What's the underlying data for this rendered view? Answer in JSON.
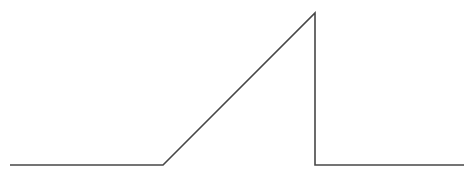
{
  "diagram": {
    "type": "waveform",
    "stroke_color": "#474747",
    "background_color": "#ffffff",
    "stroke_width": 1.6,
    "points": [
      {
        "x": 10,
        "y": 165
      },
      {
        "x": 163,
        "y": 165
      },
      {
        "x": 315,
        "y": 13
      },
      {
        "x": 315,
        "y": 165
      },
      {
        "x": 464,
        "y": 165
      }
    ],
    "segments": [
      {
        "name": "baseline-left",
        "from": [
          10,
          165
        ],
        "to": [
          163,
          165
        ]
      },
      {
        "name": "ramp-rise",
        "from": [
          163,
          165
        ],
        "to": [
          315,
          13
        ]
      },
      {
        "name": "vertical-drop",
        "from": [
          315,
          13
        ],
        "to": [
          315,
          165
        ]
      },
      {
        "name": "baseline-right",
        "from": [
          315,
          165
        ],
        "to": [
          464,
          165
        ]
      }
    ]
  }
}
